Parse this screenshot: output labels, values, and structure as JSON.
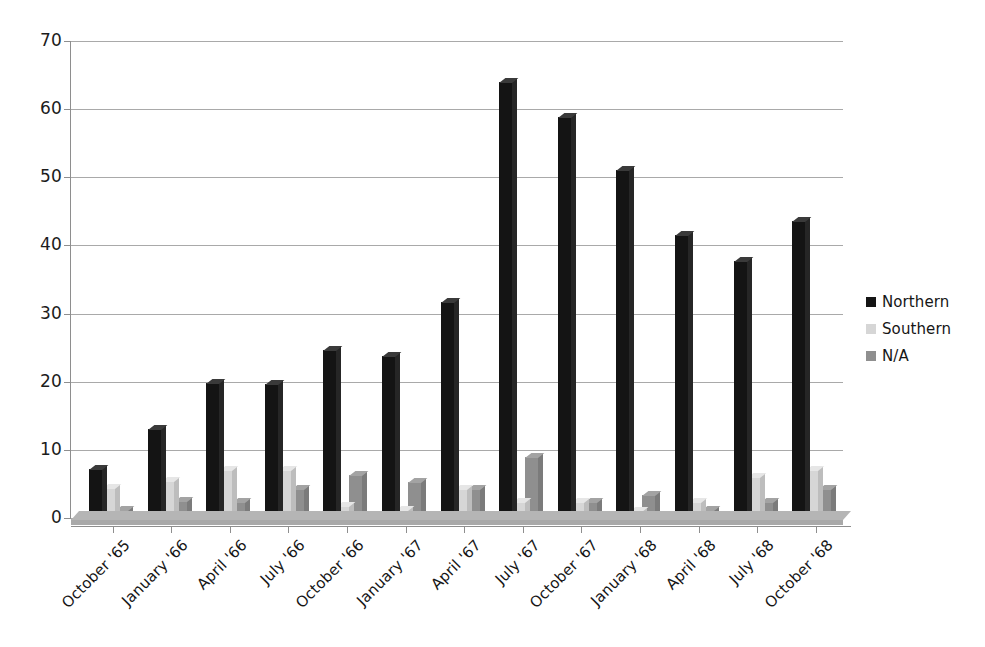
{
  "chart_data": {
    "type": "bar",
    "title": "",
    "subtitle": "",
    "xlabel": "",
    "ylabel": "",
    "ylim": [
      0,
      70
    ],
    "ytick_step": 10,
    "yticks": [
      "0",
      "10",
      "20",
      "30",
      "40",
      "50",
      "60",
      "70"
    ],
    "grid": true,
    "legend_position": "right",
    "grouping": "clustered",
    "style": "3d-column",
    "categories": [
      "October '65",
      "January '66",
      "April '66",
      "July '66",
      "October '66",
      "January '67",
      "April '67",
      "July '67",
      "October '67",
      "January '68",
      "April '68",
      "July '68",
      "October '68"
    ],
    "series": [
      {
        "name": "Northern",
        "color": "#141414",
        "values": [
          7.2,
          13,
          19.8,
          19.6,
          24.7,
          23.8,
          31.7,
          64,
          58.8,
          51,
          41.6,
          37.7,
          43.6
        ]
      },
      {
        "name": "Southern",
        "color": "#d6d6d6",
        "values": [
          4.4,
          5.4,
          7.1,
          7.1,
          1.7,
          1.2,
          4.3,
          2.4,
          2.3,
          1.0,
          2.3,
          6.0,
          7.0
        ]
      },
      {
        "name": "N/A",
        "color": "#8f8f8f",
        "values": [
          1.2,
          2.5,
          2.4,
          4.3,
          6.3,
          5.3,
          4.3,
          9.0,
          2.4,
          3.4,
          1.2,
          2.4,
          4.3
        ]
      }
    ]
  },
  "legend": {
    "items": [
      {
        "label": "Northern",
        "color": "#141414"
      },
      {
        "label": "Southern",
        "color": "#d6d6d6"
      },
      {
        "label": "N/A",
        "color": "#8f8f8f"
      }
    ]
  }
}
